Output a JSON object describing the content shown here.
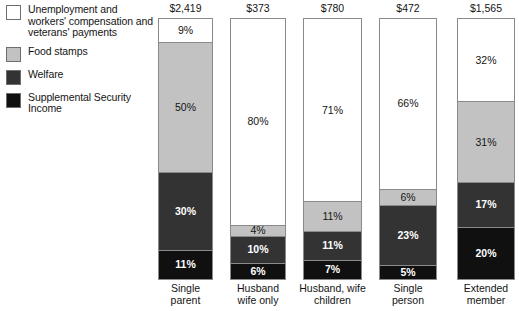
{
  "legend": {
    "items": [
      {
        "label": "Unemployment and workers' compensation and veterans' payments",
        "color": "#ffffff",
        "key": "unemployment"
      },
      {
        "label": "Food stamps",
        "color": "#c2c2c2",
        "key": "food-stamps"
      },
      {
        "label": "Welfare",
        "color": "#333333",
        "key": "welfare"
      },
      {
        "label": "Supplemental Security Income",
        "color": "#101010",
        "key": "ssi"
      }
    ]
  },
  "chart_data": {
    "type": "bar",
    "subtype": "stacked-percentage",
    "title": "",
    "xlabel": "",
    "ylabel": "",
    "ylim": [
      0,
      100
    ],
    "grid": false,
    "legend_position": "left",
    "categories": [
      "Single parent",
      "Husband wife only",
      "Husband, wife children",
      "Single person",
      "Extended member"
    ],
    "category_lines": [
      [
        "Single",
        "parent"
      ],
      [
        "Husband",
        "wife only"
      ],
      [
        "Husband, wife",
        "children"
      ],
      [
        "Single",
        "person"
      ],
      [
        "Extended",
        "member"
      ]
    ],
    "totals": [
      "$2,419",
      "$373",
      "$780",
      "$472",
      "$1,565"
    ],
    "series": [
      {
        "name": "Unemployment and workers' compensation and veterans' payments",
        "color": "#ffffff",
        "text_color": "#141414",
        "values": [
          9,
          80,
          71,
          66,
          32
        ]
      },
      {
        "name": "Food stamps",
        "color": "#c2c2c2",
        "text_color": "#141414",
        "values": [
          50,
          4,
          11,
          6,
          31
        ]
      },
      {
        "name": "Welfare",
        "color": "#333333",
        "text_color": "#ffffff",
        "values": [
          30,
          10,
          11,
          23,
          17
        ]
      },
      {
        "name": "Supplemental Security Income",
        "color": "#101010",
        "text_color": "#ffffff",
        "values": [
          11,
          6,
          7,
          5,
          20
        ]
      }
    ],
    "value_labels": [
      [
        "9%",
        "50%",
        "30%",
        "11%"
      ],
      [
        "80%",
        "4%",
        "10%",
        "6%"
      ],
      [
        "71%",
        "11%",
        "11%",
        "7%"
      ],
      [
        "66%",
        "6%",
        "23%",
        "5%"
      ],
      [
        "32%",
        "31%",
        "17%",
        "20%"
      ]
    ]
  },
  "layout": {
    "bar_left": [
      158,
      230,
      303,
      379,
      457
    ],
    "bar_width": [
      55,
      56,
      59,
      58,
      58
    ]
  }
}
